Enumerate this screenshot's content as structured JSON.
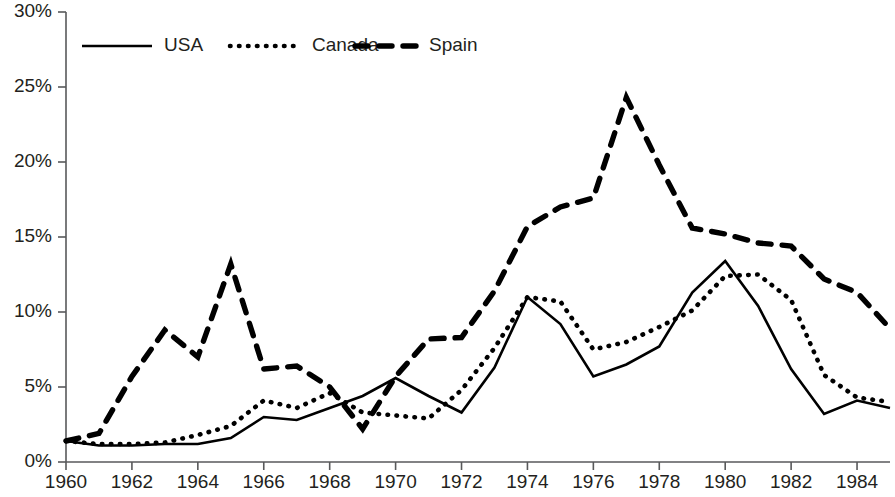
{
  "chart_data": {
    "type": "line",
    "title": "",
    "xlabel": "",
    "ylabel": "",
    "xlim": [
      1960,
      1985
    ],
    "ylim": [
      0,
      30
    ],
    "y_tick_values": [
      0,
      5,
      10,
      15,
      20,
      25,
      30
    ],
    "y_tick_labels": [
      "0%",
      "5%",
      "10%",
      "15%",
      "20%",
      "25%",
      "30%"
    ],
    "x_tick_values": [
      1960,
      1962,
      1964,
      1966,
      1968,
      1970,
      1972,
      1974,
      1976,
      1978,
      1980,
      1982,
      1984
    ],
    "x_tick_labels": [
      "1960",
      "1962",
      "1964",
      "1966",
      "1968",
      "1970",
      "1972",
      "1974",
      "1976",
      "1978",
      "1980",
      "1982",
      "1984"
    ],
    "grid": false,
    "legend_position": "top-left-inside",
    "x": [
      1960,
      1961,
      1962,
      1963,
      1964,
      1965,
      1966,
      1967,
      1968,
      1969,
      1970,
      1971,
      1972,
      1973,
      1974,
      1975,
      1976,
      1977,
      1978,
      1979,
      1980,
      1981,
      1982,
      1983,
      1984,
      1985
    ],
    "series": [
      {
        "name": "USA",
        "style": "solid",
        "color": "#000000",
        "values": [
          1.4,
          1.1,
          1.1,
          1.2,
          1.2,
          1.6,
          3.0,
          2.8,
          3.6,
          4.4,
          5.6,
          4.4,
          3.3,
          6.3,
          11.0,
          9.2,
          5.7,
          6.5,
          7.7,
          11.3,
          13.4,
          10.4,
          6.2,
          3.2,
          4.1,
          3.6
        ]
      },
      {
        "name": "Canada",
        "style": "dotted",
        "color": "#000000",
        "values": [
          1.4,
          1.2,
          1.2,
          1.3,
          1.8,
          2.4,
          4.1,
          3.6,
          4.6,
          3.3,
          3.1,
          2.9,
          4.8,
          7.6,
          11.0,
          10.7,
          7.5,
          8.0,
          9.0,
          10.1,
          12.4,
          12.5,
          10.8,
          5.8,
          4.3,
          4.0
        ]
      },
      {
        "name": "Spain",
        "style": "dashed",
        "color": "#000000",
        "values": [
          1.4,
          1.9,
          5.7,
          8.8,
          7.0,
          13.2,
          6.2,
          6.4,
          5.0,
          2.2,
          5.7,
          8.2,
          8.3,
          11.4,
          15.7,
          17.0,
          17.6,
          24.3,
          19.8,
          15.6,
          15.2,
          14.6,
          14.4,
          12.2,
          11.3,
          8.9
        ]
      }
    ],
    "legend": [
      {
        "label": "USA",
        "style": "solid"
      },
      {
        "label": "Canada",
        "style": "dotted"
      },
      {
        "label": "Spain",
        "style": "dashed"
      }
    ]
  }
}
